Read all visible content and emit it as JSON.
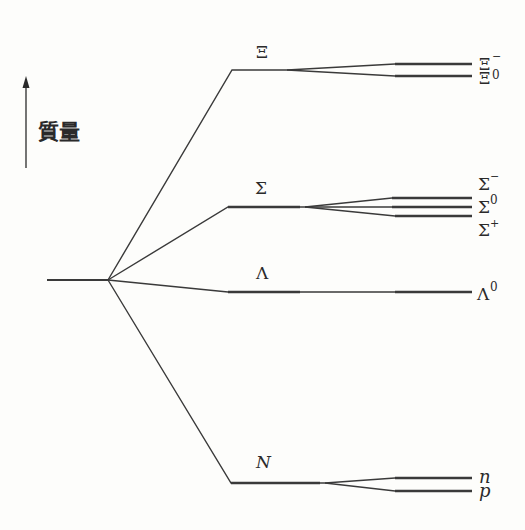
{
  "diagram": {
    "axis": {
      "label": "質量",
      "direction": "up"
    },
    "groups": [
      {
        "name": "Xi",
        "label": "Ξ",
        "members": [
          {
            "label": "Ξ",
            "sup": "−"
          },
          {
            "label": "Ξ",
            "sup": "0"
          }
        ]
      },
      {
        "name": "Sigma",
        "label": "Σ",
        "members": [
          {
            "label": "Σ",
            "sup": "−"
          },
          {
            "label": "Σ",
            "sup": "0"
          },
          {
            "label": "Σ",
            "sup": "+"
          }
        ]
      },
      {
        "name": "Lambda",
        "label": "Λ",
        "members": [
          {
            "label": "Λ",
            "sup": "0"
          }
        ]
      },
      {
        "name": "Nucleon",
        "label": "N",
        "members": [
          {
            "label": "n",
            "sup": ""
          },
          {
            "label": "p",
            "sup": ""
          }
        ]
      }
    ]
  }
}
